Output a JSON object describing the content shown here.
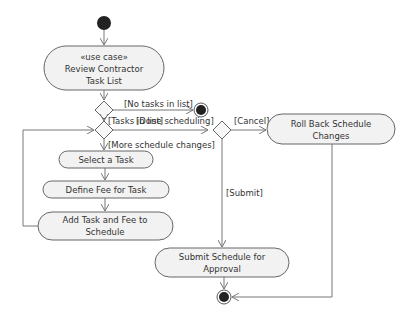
{
  "diagram": {
    "type": "UML activity diagram",
    "nodes": {
      "start": {
        "kind": "initial"
      },
      "review": {
        "stereotype": "«use case»",
        "line1": "Review Contractor",
        "line2": "Task List"
      },
      "select": {
        "label": "Select a Task"
      },
      "define": {
        "label": "Define Fee for Task"
      },
      "add": {
        "line1": "Add Task and Fee to",
        "line2": "Schedule"
      },
      "rollback": {
        "line1": "Roll Back Schedule",
        "line2": "Changes"
      },
      "submit": {
        "line1": "Submit Schedule for",
        "line2": "Approval"
      },
      "end_top": {
        "kind": "final"
      },
      "end_bottom": {
        "kind": "final"
      }
    },
    "guards": {
      "no_tasks": "[No tasks in list]",
      "tasks_in_list": "[Tasks in list]",
      "done_scheduling": "[Done scheduling]",
      "more_changes": "[More schedule changes]",
      "cancel": "[Cancel]",
      "submit": "[Submit]"
    },
    "colors": {
      "node_fill": "#f2f2f2",
      "stroke": "#666666",
      "text": "#333333",
      "terminal": "#222222"
    }
  }
}
